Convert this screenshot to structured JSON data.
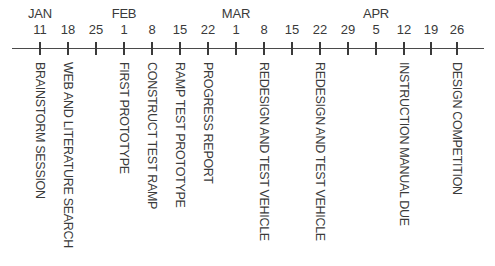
{
  "timeline": {
    "axis": {
      "x_start": 12,
      "x_end": 484,
      "y": 48,
      "color": "#4a4a4a"
    },
    "months": [
      {
        "label": "JAN",
        "x": 40
      },
      {
        "label": "FEB",
        "x": 124
      },
      {
        "label": "MAR",
        "x": 236
      },
      {
        "label": "APR",
        "x": 376
      }
    ],
    "ticks": [
      {
        "day": "11",
        "x": 40
      },
      {
        "day": "18",
        "x": 68
      },
      {
        "day": "25",
        "x": 96
      },
      {
        "day": "1",
        "x": 124
      },
      {
        "day": "8",
        "x": 152
      },
      {
        "day": "15",
        "x": 180
      },
      {
        "day": "22",
        "x": 208
      },
      {
        "day": "1",
        "x": 236
      },
      {
        "day": "8",
        "x": 264
      },
      {
        "day": "15",
        "x": 292
      },
      {
        "day": "22",
        "x": 320
      },
      {
        "day": "29",
        "x": 348
      },
      {
        "day": "5",
        "x": 376
      },
      {
        "day": "12",
        "x": 404
      },
      {
        "day": "19",
        "x": 431
      },
      {
        "day": "26",
        "x": 457
      }
    ],
    "events": [
      {
        "label": "BRAINSTORM SESSION",
        "x": 40
      },
      {
        "label": "WEB AND LITERATURE SEARCH",
        "x": 68
      },
      {
        "label": "FIRST PROTOTYPE",
        "x": 124
      },
      {
        "label": "CONSTRUCT TEST RAMP",
        "x": 152
      },
      {
        "label": "RAMP TEST PROTOTYPE",
        "x": 180
      },
      {
        "label": "PROGRESS REPORT",
        "x": 208
      },
      {
        "label": "REDESIGN AND TEST VEHICLE",
        "x": 264
      },
      {
        "label": "REDESIGN AND TEST VEHICLE",
        "x": 320
      },
      {
        "label": "INSTRUCTION MANUAL DUE",
        "x": 404
      },
      {
        "label": "DESIGN COMPETITION",
        "x": 457
      }
    ]
  }
}
